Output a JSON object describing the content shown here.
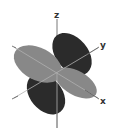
{
  "diagram": {
    "type": "d-orbital",
    "axes": {
      "z": "z",
      "y": "y",
      "x": "x"
    },
    "lobes": [
      {
        "name": "upper-back-lobe",
        "shade": "dark"
      },
      {
        "name": "left-front-lobe",
        "shade": "light"
      },
      {
        "name": "lower-left-lobe",
        "shade": "dark"
      },
      {
        "name": "lower-right-lobe",
        "shade": "light"
      }
    ],
    "colors": {
      "dark_lobe": "#2b2b2b",
      "light_lobe": "#888888",
      "axis_line": "#555555",
      "axis_on_lobe": "#b0b0b0",
      "background": "#ffffff"
    }
  }
}
